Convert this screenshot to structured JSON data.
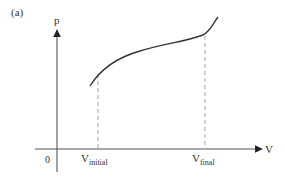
{
  "figure": {
    "panel_label": "(a)",
    "y_axis_label": "p",
    "x_axis_label": "V",
    "origin_label": "0",
    "v_initial": {
      "base": "V",
      "sub": "initial"
    },
    "v_final": {
      "base": "V",
      "sub": "final"
    }
  },
  "colors": {
    "axis": "#555555",
    "curve": "#333333",
    "dashed": "#9a9a9a",
    "text": "#333333"
  }
}
